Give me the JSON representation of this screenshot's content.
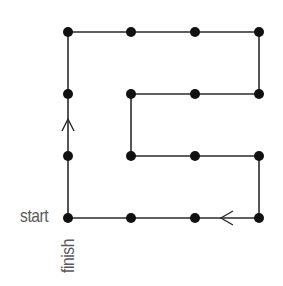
{
  "diagram": {
    "labels": {
      "start": "start",
      "finish": "finish"
    },
    "colors": {
      "line": "#2b2b2b",
      "dot": "#111111",
      "text": "#5a5a5a",
      "background": "#ffffff"
    },
    "grid": {
      "columns": [
        68,
        131,
        195,
        259
      ],
      "rows": [
        32,
        94,
        156,
        218
      ]
    },
    "dots": [
      {
        "x": 68,
        "y": 32
      },
      {
        "x": 131,
        "y": 32
      },
      {
        "x": 195,
        "y": 32
      },
      {
        "x": 259,
        "y": 32
      },
      {
        "x": 68,
        "y": 94
      },
      {
        "x": 131,
        "y": 94
      },
      {
        "x": 195,
        "y": 94
      },
      {
        "x": 259,
        "y": 94
      },
      {
        "x": 68,
        "y": 156
      },
      {
        "x": 131,
        "y": 156
      },
      {
        "x": 195,
        "y": 156
      },
      {
        "x": 259,
        "y": 156
      },
      {
        "x": 68,
        "y": 218
      },
      {
        "x": 131,
        "y": 218
      },
      {
        "x": 195,
        "y": 218
      },
      {
        "x": 259,
        "y": 218
      }
    ],
    "path": [
      {
        "x": 68,
        "y": 218
      },
      {
        "x": 131,
        "y": 218
      },
      {
        "x": 195,
        "y": 218
      },
      {
        "x": 259,
        "y": 218
      },
      {
        "x": 259,
        "y": 156
      },
      {
        "x": 195,
        "y": 156
      },
      {
        "x": 131,
        "y": 156
      },
      {
        "x": 131,
        "y": 94
      },
      {
        "x": 195,
        "y": 94
      },
      {
        "x": 259,
        "y": 94
      },
      {
        "x": 259,
        "y": 32
      },
      {
        "x": 195,
        "y": 32
      },
      {
        "x": 131,
        "y": 32
      },
      {
        "x": 68,
        "y": 32
      },
      {
        "x": 68,
        "y": 94
      },
      {
        "x": 68,
        "y": 156
      },
      {
        "x": 68,
        "y": 218
      }
    ],
    "arrows": [
      {
        "direction": "left",
        "x": 221,
        "y": 218
      },
      {
        "direction": "up",
        "x": 68,
        "y": 119
      }
    ]
  }
}
